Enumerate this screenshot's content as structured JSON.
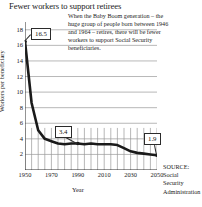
{
  "chart_data": {
    "type": "line",
    "title": "Fewer workers to support retirees",
    "xlabel": "Year",
    "ylabel": "Workers per beneficiary",
    "xlim": [
      1950,
      2050
    ],
    "ylim": [
      0,
      19
    ],
    "xticks": [
      1950,
      1970,
      1990,
      2010,
      2030,
      2050
    ],
    "yticks": [
      2,
      4,
      6,
      8,
      10,
      12,
      14,
      16,
      18
    ],
    "grid": true,
    "legend": "none",
    "x": [
      1950,
      1955,
      1960,
      1965,
      1970,
      1975,
      1980,
      1985,
      1990,
      1995,
      2000,
      2005,
      2010,
      2015,
      2020,
      2025,
      2030,
      2035,
      2040,
      2045,
      2050
    ],
    "values": [
      16.5,
      8.6,
      5.1,
      4.0,
      3.7,
      3.4,
      3.3,
      3.4,
      3.4,
      3.3,
      3.4,
      3.3,
      3.3,
      3.3,
      3.2,
      2.8,
      2.4,
      2.2,
      2.1,
      2.0,
      1.9
    ],
    "annotations": [
      {
        "label": "16.5",
        "x": 1950,
        "y": 16.5
      },
      {
        "label": "3.4",
        "x": 1990,
        "y": 3.4
      },
      {
        "label": "1.9",
        "x": 2050,
        "y": 1.9
      }
    ],
    "note": "When the Baby Boom generation – the huge group of people born between 1946 and 1964 – retires, there will be fewer workers to support Social Security beneficiaries.",
    "source_label": "SOURCE:",
    "source_lines": [
      "Social",
      "Security",
      "Administration"
    ]
  },
  "colors": {
    "line": "#1a1a1a",
    "grid": "#9a9a9a",
    "axis": "#2b2b2b",
    "background": "#ffffff",
    "text": "#1a1a1a"
  }
}
